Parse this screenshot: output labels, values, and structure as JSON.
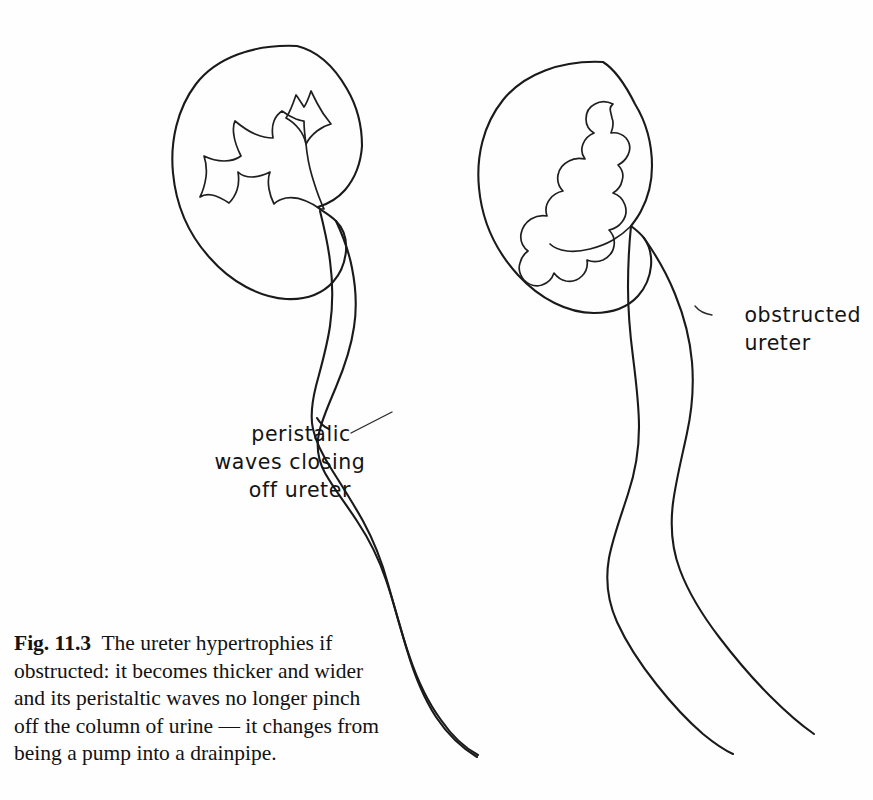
{
  "figure": {
    "number": "Fig. 11.3",
    "caption_body": "The ureter hypertrophies if obstructed: it becomes thicker and wider and its peristaltic waves no longer pinch off the column of urine — it changes from being a pump into a drainpipe.",
    "caption_lines": [
      "The ureter hypertrophies if",
      "obstructed: it becomes thicker and wider",
      "and its peristaltic waves no longer pinch",
      "off the column of urine — it changes from",
      "being a pump into a drainpipe."
    ]
  },
  "annotations": {
    "left": {
      "lines": [
        "peristalic",
        "waves closing",
        "off ureter"
      ],
      "full_text": "peristalic waves closing off ureter",
      "points_to": "normal-ureter-pinch-point"
    },
    "right": {
      "lines": [
        "obstructed",
        "ureter"
      ],
      "full_text": "obstructed ureter",
      "points_to": "obstructed-ureter-wall"
    }
  },
  "diagram": {
    "type": "medical-line-illustration",
    "panels": [
      {
        "name": "normal-kidney-panel",
        "side": "left",
        "kidney_state": "normal",
        "calyces": "sharp pointed narrow calyces",
        "pelvis": "narrow funnel-shaped renal pelvis",
        "ureter_state": "narrow lumen with peristaltic waves pinching it closed"
      },
      {
        "name": "obstructed-kidney-panel",
        "side": "right",
        "kidney_state": "hydronephrotic",
        "calyces": "dilated blunted club-shaped calyces",
        "pelvis": "dilated renal pelvis",
        "ureter_state": "uniformly wide dilated lumen, waves do not occlude"
      }
    ]
  },
  "colors": {
    "ink": "#1a1a1a",
    "background": "#fefefe",
    "text": "#121212",
    "leader": "#2a2a2a"
  }
}
